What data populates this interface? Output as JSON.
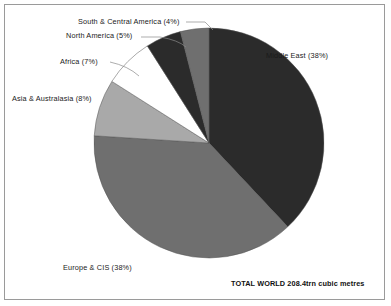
{
  "chart_data": {
    "type": "pie",
    "title": "",
    "subtitle": "",
    "xlabel": "",
    "ylabel": "",
    "legend_position": "none",
    "grid": false,
    "total_label": "TOTAL WORLD 208.4trn cubic metres",
    "total_value": 208.4,
    "total_unit": "trn cubic metres",
    "start_angle_deg": 0,
    "direction": "clockwise",
    "categories": [
      "Middle East",
      "Europe & CIS",
      "Asia & Australasia",
      "Africa",
      "North America",
      "South & Central America"
    ],
    "values": [
      38,
      38,
      8,
      7,
      5,
      4
    ],
    "labels": [
      "Middle East (38%)",
      "Europe & CIS (38%)",
      "Asia & Australasia (8%)",
      "Africa (7%)",
      "North America (5%)",
      "South & Central America (4%)"
    ],
    "colors": [
      "#2b2b2b",
      "#6f6f6f",
      "#a9a9a9",
      "#ffffff",
      "#2b2b2b",
      "#6f6f6f"
    ],
    "slices": [
      {
        "name": "Middle East",
        "label": "Middle East (38%)",
        "value": 38,
        "color": "#2b2b2b"
      },
      {
        "name": "Europe & CIS",
        "label": "Europe & CIS (38%)",
        "value": 38,
        "color": "#6f6f6f"
      },
      {
        "name": "Asia & Australasia",
        "label": "Asia & Australasia (8%)",
        "value": 8,
        "color": "#a9a9a9"
      },
      {
        "name": "Africa",
        "label": "Africa (7%)",
        "value": 7,
        "color": "#ffffff"
      },
      {
        "name": "North America",
        "label": "North America (5%)",
        "value": 5,
        "color": "#2b2b2b"
      },
      {
        "name": "South & Central America",
        "label": "South & Central America (4%)",
        "value": 4,
        "color": "#6f6f6f"
      }
    ]
  }
}
